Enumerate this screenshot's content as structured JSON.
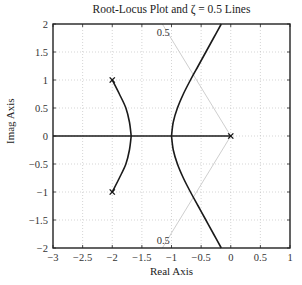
{
  "chart_data": {
    "type": "line",
    "title": "Root-Locus Plot and ζ = 0.5 Lines",
    "xlabel": "Real Axis",
    "ylabel": "Imag Axis",
    "xlim": [
      -3,
      1
    ],
    "ylim": [
      -2,
      2
    ],
    "grid": true,
    "x_ticks": [
      -3,
      -2.5,
      -2,
      -1.5,
      -1,
      -0.5,
      0,
      0.5,
      1
    ],
    "x_tick_labels": [
      "−3",
      "−2.5",
      "−2",
      "−1.5",
      "−1",
      "−0.5",
      "0",
      "0.5",
      "1"
    ],
    "y_ticks": [
      2,
      1.5,
      1,
      0.5,
      0,
      -0.5,
      -1,
      -1.5,
      -2
    ],
    "y_tick_labels": [
      "2",
      "1.5",
      "1",
      "0.5",
      "0",
      "−0.5",
      "−1",
      "−1.5",
      "−2"
    ],
    "poles": [
      {
        "re": -2,
        "im": 1
      },
      {
        "re": -2,
        "im": -1
      },
      {
        "re": 0,
        "im": 0
      }
    ],
    "series": [
      {
        "name": "locus-branch-upper-complex",
        "points": [
          [
            -2,
            1
          ],
          [
            -1.88,
            0.75
          ],
          [
            -1.77,
            0.5
          ],
          [
            -1.71,
            0.25
          ],
          [
            -1.68,
            0
          ]
        ]
      },
      {
        "name": "locus-branch-lower-complex",
        "points": [
          [
            -2,
            -1
          ],
          [
            -1.88,
            -0.75
          ],
          [
            -1.77,
            -0.5
          ],
          [
            -1.71,
            -0.25
          ],
          [
            -1.68,
            0
          ]
        ]
      },
      {
        "name": "locus-branch-right-upper",
        "points": [
          [
            -1,
            0
          ],
          [
            -0.97,
            0.25
          ],
          [
            -0.9,
            0.5
          ],
          [
            -0.8,
            0.75
          ],
          [
            -0.68,
            1
          ],
          [
            -0.55,
            1.25
          ],
          [
            -0.42,
            1.5
          ],
          [
            -0.29,
            1.75
          ],
          [
            -0.16,
            2
          ]
        ]
      },
      {
        "name": "locus-branch-right-lower",
        "points": [
          [
            -1,
            0
          ],
          [
            -0.97,
            -0.25
          ],
          [
            -0.9,
            -0.5
          ],
          [
            -0.8,
            -0.75
          ],
          [
            -0.68,
            -1
          ],
          [
            -0.55,
            -1.25
          ],
          [
            -0.42,
            -1.5
          ],
          [
            -0.29,
            -1.75
          ],
          [
            -0.16,
            -2
          ]
        ]
      },
      {
        "name": "real-axis-locus",
        "points": [
          [
            -3,
            0
          ],
          [
            0,
            0
          ]
        ]
      },
      {
        "name": "zeta-0.5-line-upper",
        "points": [
          [
            0,
            0
          ],
          [
            -1.155,
            2
          ]
        ]
      },
      {
        "name": "zeta-0.5-line-lower",
        "points": [
          [
            0,
            0
          ],
          [
            -1.155,
            -2
          ]
        ]
      }
    ],
    "annotations": [
      {
        "text": "0.5",
        "re": -1.25,
        "im": 1.85
      },
      {
        "text": "0.5",
        "re": -1.25,
        "im": -1.85
      }
    ]
  }
}
